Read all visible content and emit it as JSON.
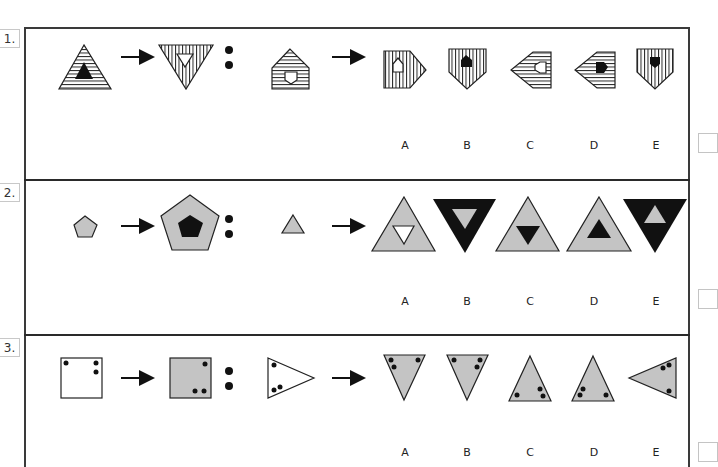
{
  "questions": [
    {
      "number": "1.",
      "options": [
        "A",
        "B",
        "C",
        "D",
        "E"
      ],
      "description": "Striped triangle with black inner triangle transforms to inverted vertically-striped triangle with white inner inverted triangle; apply analogous rule to house shape with horizontal stripes and white inner shield"
    },
    {
      "number": "2.",
      "options": [
        "A",
        "B",
        "C",
        "D",
        "E"
      ],
      "description": "Small grey pentagon becomes large grey pentagon with black inner pentagon; apply to small grey triangle"
    },
    {
      "number": "3.",
      "options": [
        "A",
        "B",
        "C",
        "D",
        "E"
      ],
      "description": "White square with dots becomes grey square with dots repositioned; apply to white triangle with dots"
    }
  ],
  "colors": {
    "grey_fill": "#c4c4c4",
    "stroke": "#2a2a2a",
    "black": "#111111",
    "border": "#3a3a3a"
  }
}
